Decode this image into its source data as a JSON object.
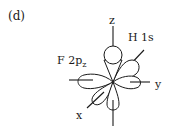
{
  "panel_label": "(d)",
  "axes": {
    "x": "x",
    "y": "y",
    "z": "z"
  },
  "orbital_labels": {
    "fluorine": "F 2p",
    "fluorine_subscript": "z",
    "hydrogen": "H 1s"
  },
  "colors": {
    "ink": "#1a1a1a",
    "background": "#ffffff"
  }
}
